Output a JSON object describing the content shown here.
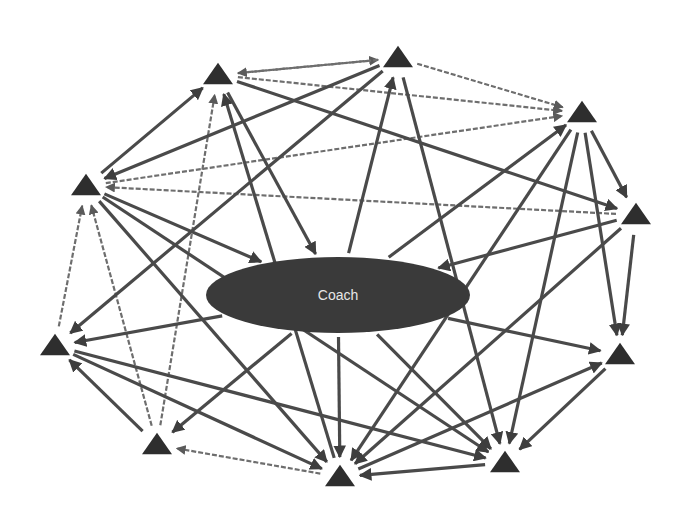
{
  "diagram": {
    "title": "",
    "center_node": {
      "id": "coach",
      "label": "Coach",
      "shape": "ellipse",
      "color": "#3a3a3a"
    },
    "nodes": [
      {
        "id": "n1",
        "shape": "triangle",
        "label": ""
      },
      {
        "id": "n2",
        "shape": "triangle",
        "label": ""
      },
      {
        "id": "n3",
        "shape": "triangle",
        "label": ""
      },
      {
        "id": "n4",
        "shape": "triangle",
        "label": ""
      },
      {
        "id": "n5",
        "shape": "triangle",
        "label": ""
      },
      {
        "id": "n6",
        "shape": "triangle",
        "label": ""
      },
      {
        "id": "n7",
        "shape": "triangle",
        "label": ""
      },
      {
        "id": "n8",
        "shape": "triangle",
        "label": ""
      },
      {
        "id": "n9",
        "shape": "triangle",
        "label": ""
      },
      {
        "id": "n10",
        "shape": "triangle",
        "label": ""
      }
    ],
    "edges": [
      {
        "from": "n1",
        "to": "n2",
        "style": "dashed"
      },
      {
        "from": "n2",
        "to": "n1",
        "style": "dashed"
      },
      {
        "from": "n2",
        "to": "n3",
        "style": "dashed"
      },
      {
        "from": "n1",
        "to": "n3",
        "style": "dashed"
      },
      {
        "from": "n10",
        "to": "n3",
        "style": "dashed"
      },
      {
        "from": "n4",
        "to": "n10",
        "style": "dashed"
      },
      {
        "from": "n9",
        "to": "n10",
        "style": "dashed"
      },
      {
        "from": "n8",
        "to": "n10",
        "style": "dashed"
      },
      {
        "from": "n8",
        "to": "n1",
        "style": "dashed"
      },
      {
        "from": "n8",
        "to": "n9",
        "style": "solid"
      },
      {
        "from": "n7",
        "to": "n8",
        "style": "dashed"
      },
      {
        "from": "n6",
        "to": "n7",
        "style": "solid"
      },
      {
        "from": "n10",
        "to": "n1",
        "style": "solid"
      },
      {
        "from": "n2",
        "to": "n10",
        "style": "solid"
      },
      {
        "from": "n2",
        "to": "n9",
        "style": "solid"
      },
      {
        "from": "n7",
        "to": "n1",
        "style": "solid"
      },
      {
        "from": "n1",
        "to": "coach",
        "style": "solid"
      },
      {
        "from": "coach",
        "to": "n2",
        "style": "solid"
      },
      {
        "from": "n2",
        "to": "n6",
        "style": "solid"
      },
      {
        "from": "n1",
        "to": "n4",
        "style": "solid"
      },
      {
        "from": "coach",
        "to": "n3",
        "style": "solid"
      },
      {
        "from": "n3",
        "to": "n4",
        "style": "solid"
      },
      {
        "from": "n3",
        "to": "n5",
        "style": "solid"
      },
      {
        "from": "n3",
        "to": "n6",
        "style": "solid"
      },
      {
        "from": "n3",
        "to": "n7",
        "style": "solid"
      },
      {
        "from": "n4",
        "to": "n5",
        "style": "solid"
      },
      {
        "from": "n4",
        "to": "coach",
        "style": "solid"
      },
      {
        "from": "n4",
        "to": "n7",
        "style": "solid"
      },
      {
        "from": "n5",
        "to": "n6",
        "style": "solid"
      },
      {
        "from": "n7",
        "to": "n5",
        "style": "solid"
      },
      {
        "from": "coach",
        "to": "n5",
        "style": "solid"
      },
      {
        "from": "coach",
        "to": "n9",
        "style": "solid"
      },
      {
        "from": "coach",
        "to": "n7",
        "style": "solid"
      },
      {
        "from": "coach",
        "to": "n6",
        "style": "solid"
      },
      {
        "from": "coach",
        "to": "n8",
        "style": "solid"
      },
      {
        "from": "n10",
        "to": "n7",
        "style": "solid"
      },
      {
        "from": "n10",
        "to": "coach",
        "style": "solid"
      },
      {
        "from": "n9",
        "to": "n6",
        "style": "solid"
      },
      {
        "from": "n9",
        "to": "n7",
        "style": "solid"
      },
      {
        "from": "n10",
        "to": "n6",
        "style": "solid"
      }
    ]
  }
}
